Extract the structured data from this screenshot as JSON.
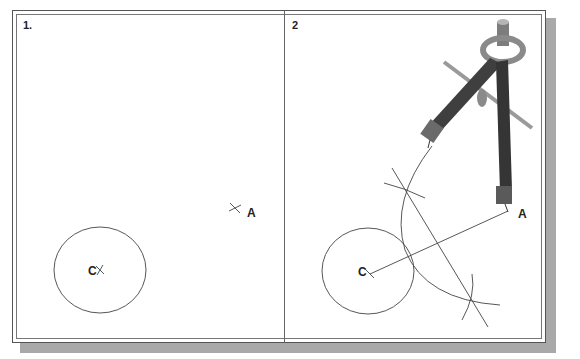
{
  "figure": {
    "panels": [
      {
        "label": "1.",
        "points": {
          "center": "C",
          "target": "A"
        }
      },
      {
        "label": "2",
        "points": {
          "center": "C",
          "target": "A"
        }
      }
    ],
    "colors": {
      "line": "#444444",
      "frame": "#555555",
      "shadow": "#a9a9a9",
      "compass_dark": "#3a3a3a",
      "compass_light": "#9a9a9a"
    }
  }
}
